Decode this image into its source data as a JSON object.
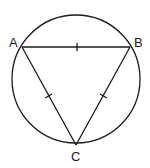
{
  "diagram": {
    "points": {
      "A": {
        "label": "A"
      },
      "B": {
        "label": "B"
      },
      "C": {
        "label": "C"
      }
    },
    "stroke_color": "#1a1a1a",
    "equal_side_marks": [
      "AB",
      "AC",
      "BC"
    ]
  }
}
